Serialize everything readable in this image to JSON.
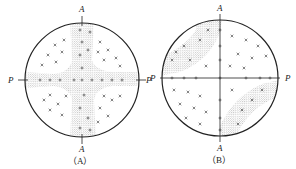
{
  "figures": [
    {
      "id": "A",
      "caption": "（A）",
      "axis_labels": {
        "top": "A",
        "bottom": "A",
        "left": "P",
        "right": "P"
      },
      "description": "Pole figure with stippled cross-shaped bands along A-A and P-P axes"
    },
    {
      "id": "B",
      "caption": "（B）",
      "axis_labels": {
        "top": "A",
        "bottom": "A",
        "left": "P",
        "right": "P"
      },
      "description": "Pole figure with stippled diagonal bands in upper-left and lower-right quadrants"
    }
  ],
  "colors": {
    "ink": "#222222",
    "stipple": "#555555",
    "background": "#ffffff"
  }
}
